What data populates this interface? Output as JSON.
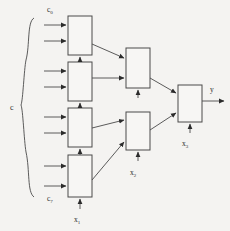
{
  "figure": {
    "type": "block-diagram",
    "background_color": "#f4f3f1",
    "line_color": "#4a4a4a",
    "block_fill": "#f7f6f4"
  },
  "labels": {
    "input_group": "c",
    "input_first": "c",
    "input_first_sub": "0",
    "input_last": "c",
    "input_last_sub": "7",
    "stage1": "x",
    "stage1_sub": "1",
    "stage2": "x",
    "stage2_sub": "2",
    "stage3": "x",
    "stage3_sub": "3",
    "output": "y"
  },
  "blocks": [
    {
      "id": "l1-b1",
      "name": "level1-block-1",
      "x": 68,
      "y": 16,
      "w": 24,
      "h": 39
    },
    {
      "id": "l1-b2",
      "name": "level1-block-2",
      "x": 68,
      "y": 62,
      "w": 24,
      "h": 39
    },
    {
      "id": "l1-b3",
      "name": "level1-block-3",
      "x": 68,
      "y": 108,
      "w": 24,
      "h": 39
    },
    {
      "id": "l1-b4",
      "name": "level1-block-4",
      "x": 68,
      "y": 155,
      "w": 24,
      "h": 42
    },
    {
      "id": "l2-b1",
      "name": "level2-block-1",
      "x": 126,
      "y": 48,
      "w": 24,
      "h": 40
    },
    {
      "id": "l2-b2",
      "name": "level2-block-2",
      "x": 126,
      "y": 112,
      "w": 24,
      "h": 38
    },
    {
      "id": "l3-b1",
      "name": "level3-output-block",
      "x": 178,
      "y": 85,
      "w": 24,
      "h": 37
    }
  ],
  "inputs": {
    "count": 8,
    "arrow_x_start": 44,
    "arrow_x_end": 68,
    "rows": [
      25,
      41,
      71,
      87,
      117,
      133,
      166,
      186
    ]
  },
  "brace": {
    "label": "c",
    "label_x": 14,
    "label_y": 108,
    "top_y": 18,
    "bottom_y": 197
  }
}
